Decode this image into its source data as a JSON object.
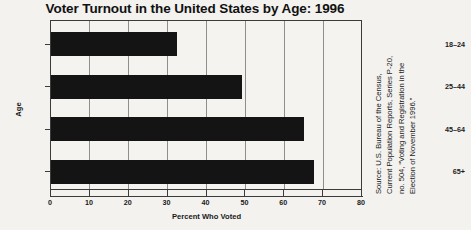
{
  "chart_data": {
    "type": "bar",
    "orientation": "horizontal",
    "title": "Voter Turnout in the United States by Age: 1996",
    "categories": [
      "18–24",
      "25–44",
      "45–64",
      "65+"
    ],
    "values": [
      32.4,
      49.2,
      65.2,
      67.9
    ],
    "xlabel": "Percent Who Voted",
    "ylabel": "Age",
    "xlim": [
      0,
      80
    ],
    "xticks": [
      0,
      10,
      20,
      30,
      40,
      50,
      60,
      70,
      80
    ],
    "xtick_labels": [
      "0",
      "10",
      "20",
      "30",
      "40",
      "50",
      "60",
      "70",
      "80"
    ],
    "grid": "vertical",
    "legend": "none",
    "bar_color": "#141414",
    "background_color": "#f3f2ef",
    "frame_color": "#3b3b3b",
    "gridline_color": "#8e8e8e"
  },
  "source_note": {
    "lines": [
      "Source: U.S. Bureau of the Census,",
      "Current Population Reports, Series P-20,",
      "no. 504, “Voting and Registration in the",
      "Election of November 1996.”"
    ]
  }
}
